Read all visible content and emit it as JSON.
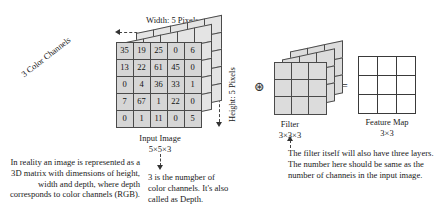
{
  "figure": {
    "title_alt": "CNN input image, filter and feature map diagram",
    "input_image": {
      "width_label": "Width: 5 Pixels",
      "height_label": "Height: 5 Pixels",
      "channels_label": "3 Color Channels",
      "caption": "Input Image",
      "dims": "5×5×3",
      "matrix": [
        [
          35,
          19,
          25,
          0,
          6
        ],
        [
          13,
          22,
          61,
          45,
          0
        ],
        [
          0,
          4,
          36,
          33,
          1
        ],
        [
          7,
          67,
          1,
          22,
          0
        ],
        [
          0,
          1,
          11,
          0,
          5
        ]
      ]
    },
    "operator": "⊛",
    "equals": "=",
    "filter": {
      "caption": "Filter",
      "dims": "3×3×3"
    },
    "feature_map": {
      "caption": "Feature Map",
      "dims": "3×3"
    },
    "annotations": {
      "left": "In reality an image is represented as a 3D matrix with dimensions of height, width and depth, where depth corresponds to color channels (RGB).",
      "middle": "3 is the numgber of color channels. It's also called as Depth.",
      "right": "The filter itself will also have three layers. The number here should be same as the number of channeis in the input image."
    }
  },
  "colors": {
    "cell_fill": "#d6d6d6",
    "cell_border": "#4a4a4a",
    "depth_fill": "#e4e4e4",
    "text": "#1a1a1a",
    "background": "#ffffff"
  }
}
